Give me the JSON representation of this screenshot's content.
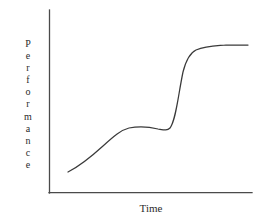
{
  "figure": {
    "background_color": "#ffffff",
    "axis_color": "#4a4a4a",
    "curve_color": "#3a3a3a",
    "text_color": "#2b2b2b"
  },
  "axes": {
    "y_label": "Performance",
    "y_label_letters": [
      "P",
      "e",
      "r",
      "f",
      "o",
      "r",
      "m",
      "a",
      "n",
      "c",
      "e"
    ],
    "x_label": "Time"
  },
  "chart_data": {
    "type": "line",
    "title": "",
    "xlabel": "Time",
    "ylabel": "Performance",
    "xlim": [
      0,
      100
    ],
    "ylim": [
      0,
      100
    ],
    "grid": false,
    "legend": null,
    "annotations": [],
    "axis_ticks": {
      "x": [],
      "y": []
    },
    "series": [
      {
        "name": "Performance over time",
        "shape": "double-sigmoid-plateau",
        "x": [
          9,
          14,
          19,
          24,
          29,
          34,
          38,
          42,
          46,
          50,
          54,
          57,
          59,
          61,
          63,
          65,
          67,
          69,
          72,
          76,
          81,
          87,
          93,
          98
        ],
        "y": [
          11,
          17,
          24,
          31,
          38,
          44,
          49,
          52,
          54,
          54,
          54,
          55,
          58,
          64,
          72,
          79,
          83,
          86,
          88,
          90,
          92,
          93,
          94,
          95
        ]
      }
    ],
    "curve_path": "M 68 172 C 80 166 92 156 103 146 C 114 136 121 130 129 128 C 139 126 150 127 158 129 C 164 130 167 131 170 128 C 176 120 178 96 183 72 C 186 60 190 53 196 50 C 206 46 215 46 226 45 C 235 45 242 45 248 45"
  },
  "geometry": {
    "y_axis_x": 49,
    "y_axis_top": 10,
    "x_axis_y": 193,
    "x_axis_right": 252
  }
}
